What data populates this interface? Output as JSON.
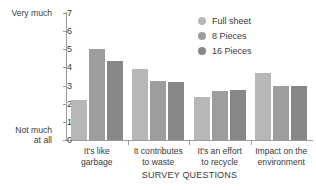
{
  "chart_data": {
    "type": "bar",
    "title": "",
    "xlabel": "SURVEY QUESTIONS",
    "ylabel": "",
    "ylim": [
      0,
      7
    ],
    "yticks": [
      0,
      1,
      2,
      3,
      4,
      5,
      6,
      7
    ],
    "grid": false,
    "legend_position": "top-right",
    "y_axis_high_label": "Very much",
    "y_axis_low_label": "Not much\nat all",
    "categories": [
      "It's like\ngarbage",
      "It contributes\nto waste",
      "It's an effort\nto recycle",
      "Impact on the\nenvironment"
    ],
    "series": [
      {
        "name": "Full sheet",
        "color": "#b7b7b7",
        "values": [
          2.2,
          3.9,
          2.35,
          3.7
        ]
      },
      {
        "name": "8 Pieces",
        "color": "#9d9d9d",
        "values": [
          5.0,
          3.25,
          2.7,
          3.0
        ]
      },
      {
        "name": "16 Pieces",
        "color": "#878787",
        "values": [
          4.35,
          3.2,
          2.75,
          3.0
        ]
      }
    ]
  }
}
